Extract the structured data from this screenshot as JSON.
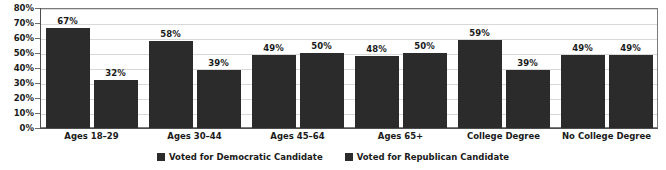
{
  "chart_data": {
    "type": "bar",
    "title": "",
    "subtitle": "",
    "xlabel": "",
    "ylabel": "",
    "ylim": [
      0,
      80
    ],
    "ytick_step": 10,
    "grid": true,
    "legend_position": "bottom-center",
    "categories": [
      "Ages 18–29",
      "Ages 30–44",
      "Ages 45–64",
      "Ages 65+",
      "College Degree",
      "No College Degree"
    ],
    "ytick_labels": [
      "0%",
      "10%",
      "20%",
      "30%",
      "40%",
      "50%",
      "60%",
      "70%",
      "80%"
    ],
    "ytick_values": [
      0,
      10,
      20,
      30,
      40,
      50,
      60,
      70,
      80
    ],
    "series": [
      {
        "name": "Voted for Democratic Candidate",
        "color": "#2b2b2b",
        "values": [
          67,
          58,
          49,
          48,
          59,
          49
        ],
        "labels": [
          "67%",
          "58%",
          "49%",
          "48%",
          "59%",
          "49%"
        ]
      },
      {
        "name": "Voted for Republican Candidate",
        "color": "#2b2b2b",
        "values": [
          32,
          39,
          50,
          50,
          39,
          49
        ],
        "labels": [
          "32%",
          "39%",
          "50%",
          "50%",
          "39%",
          "49%"
        ]
      }
    ]
  },
  "legend": {
    "items": [
      {
        "label": "Voted for Democratic Candidate",
        "color": "#2b2b2b"
      },
      {
        "label": "Voted for Republican Candidate",
        "color": "#2b2b2b"
      }
    ]
  },
  "style": {
    "background": "#ffffff",
    "gridline_color": "#d8d8d8",
    "axis_color": "#4d4d4d",
    "plot_border_color": "#7a7a7a",
    "text_color": "#1a1a1a"
  }
}
